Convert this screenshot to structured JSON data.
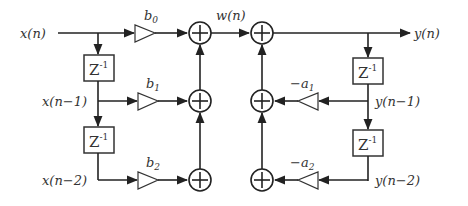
{
  "diagram": {
    "type": "Direct Form I IIR filter (second-order)",
    "input_label": "x(n)",
    "intermediate_label": "w(n)",
    "output_label": "y(n)",
    "delay_label": "Z",
    "delay_exponent": "-1",
    "feedforward": {
      "taps": [
        {
          "signal": "x(n)",
          "coef": "b",
          "sub": "0"
        },
        {
          "signal": "x(n−1)",
          "coef": "b",
          "sub": "1"
        },
        {
          "signal": "x(n−2)",
          "coef": "b",
          "sub": "2"
        }
      ]
    },
    "feedback": {
      "taps": [
        {
          "signal": "y(n−1)",
          "coef": "−a",
          "sub": "1"
        },
        {
          "signal": "y(n−2)",
          "coef": "−a",
          "sub": "2"
        }
      ]
    },
    "adder_symbol": "+",
    "colors": {
      "stroke": "#222222",
      "text": "#333333",
      "background": "#ffffff"
    }
  }
}
